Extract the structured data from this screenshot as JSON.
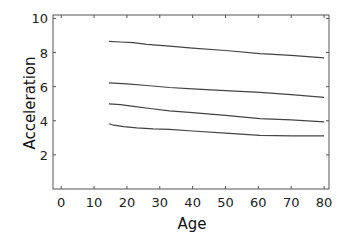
{
  "chart_data": {
    "type": "line",
    "title": "",
    "xlabel": "Age",
    "ylabel": "Acceleration",
    "xlim": [
      -2.5,
      81.5
    ],
    "ylim": [
      0,
      10.2
    ],
    "xticks": [
      0,
      10,
      20,
      30,
      40,
      50,
      60,
      70,
      80
    ],
    "yticks": [
      2,
      4,
      6,
      8,
      10
    ],
    "grid": false,
    "legend": null,
    "line_color": "#444444",
    "series": [
      {
        "name": "curve-1",
        "x": [
          14.5,
          18,
          22,
          26,
          33,
          40,
          50,
          60.5,
          70,
          80
        ],
        "y": [
          8.66,
          8.62,
          8.58,
          8.48,
          8.37,
          8.26,
          8.12,
          7.94,
          7.84,
          7.69
        ]
      },
      {
        "name": "curve-2",
        "x": [
          14.5,
          20,
          26,
          33,
          40,
          50,
          60.5,
          70,
          80
        ],
        "y": [
          6.22,
          6.16,
          6.07,
          5.95,
          5.87,
          5.77,
          5.66,
          5.53,
          5.37
        ]
      },
      {
        "name": "curve-3",
        "x": [
          14.5,
          18,
          22,
          27,
          33,
          40,
          50,
          60.5,
          70,
          80
        ],
        "y": [
          4.99,
          4.94,
          4.84,
          4.72,
          4.58,
          4.48,
          4.32,
          4.12,
          4.05,
          3.94
        ]
      },
      {
        "name": "curve-4",
        "x": [
          14.5,
          16,
          19,
          23,
          28,
          33,
          40,
          50,
          60.5,
          70,
          80
        ],
        "y": [
          3.83,
          3.74,
          3.65,
          3.58,
          3.53,
          3.5,
          3.4,
          3.27,
          3.15,
          3.12,
          3.11
        ]
      }
    ]
  }
}
